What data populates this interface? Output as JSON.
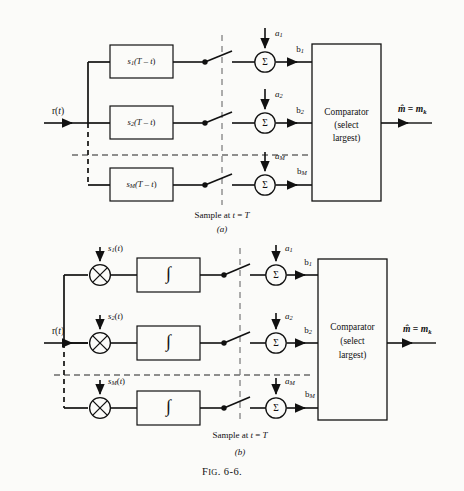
{
  "figure": {
    "caption": "Fɪɢ. 6-6.",
    "caption_plain": "FIG. 6-6.",
    "panel_a_label": "(a)",
    "panel_b_label": "(b)"
  },
  "common": {
    "input_signal": "r(t)",
    "sample_note": "Sample at t = T",
    "comparator_line1": "Comparator",
    "comparator_line2": "(select",
    "comparator_line3": "largest)",
    "output_label": "m̂ = mk",
    "output_hat": "^",
    "output_m": "m",
    "output_eq": "=",
    "output_mk": "m",
    "output_k": "k",
    "sum_symbol": "Σ",
    "multiply_symbol": "×",
    "integral_symbol": "∫"
  },
  "panel_a": {
    "type": "matched-filter-receiver",
    "branches": [
      {
        "filter": "s1(T - t)",
        "filter_base": "s",
        "filter_sub": "1",
        "filter_arg": "(T − t)",
        "bias": "a1",
        "bias_base": "a",
        "bias_sub": "1",
        "out": "b1",
        "out_base": "b",
        "out_sub": "1"
      },
      {
        "filter": "s2(T - t)",
        "filter_base": "s",
        "filter_sub": "2",
        "filter_arg": "(T − t)",
        "bias": "a2",
        "bias_base": "a",
        "bias_sub": "2",
        "out": "b2",
        "out_base": "b",
        "out_sub": "2"
      },
      {
        "filter": "sM(T - t)",
        "filter_base": "s",
        "filter_sub": "M",
        "filter_arg": "(T − t)",
        "bias": "aM",
        "bias_base": "a",
        "bias_sub": "M",
        "out": "bM",
        "out_base": "b",
        "out_sub": "M"
      }
    ]
  },
  "panel_b": {
    "type": "correlation-receiver",
    "branches": [
      {
        "ref": "s1(t)",
        "ref_base": "s",
        "ref_sub": "1",
        "ref_arg": "(t)",
        "bias": "a1",
        "bias_base": "a",
        "bias_sub": "1",
        "out": "b1",
        "out_base": "b",
        "out_sub": "1"
      },
      {
        "ref": "s2(t)",
        "ref_base": "s",
        "ref_sub": "2",
        "ref_arg": "(t)",
        "bias": "a2",
        "bias_base": "a",
        "bias_sub": "2",
        "out": "b2",
        "out_base": "b",
        "out_sub": "2"
      },
      {
        "ref": "sM(t)",
        "ref_base": "s",
        "ref_sub": "M",
        "ref_arg": "(t)",
        "bias": "aM",
        "bias_base": "a",
        "bias_sub": "M",
        "out": "bM",
        "out_base": "b",
        "out_sub": "M"
      }
    ]
  },
  "colors": {
    "ink": "#111111",
    "paper": "#fbfbf9",
    "dash": "#222222"
  }
}
